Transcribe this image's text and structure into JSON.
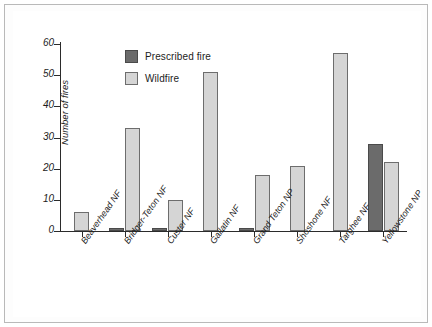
{
  "chart_data": {
    "type": "bar",
    "title": "",
    "xlabel": "",
    "ylabel": "Number of fires",
    "ylim": [
      0,
      60
    ],
    "yticks": [
      0,
      10,
      20,
      30,
      40,
      50,
      60
    ],
    "grid": false,
    "legend_position": "top-left",
    "categories": [
      "Beaverhead NF",
      "Bridger-Teton NF",
      "Custer NF",
      "Gallatin NF",
      "Grand Teton NP",
      "Shoshone NF",
      "Targhee NF",
      "Yellowstone NP"
    ],
    "series": [
      {
        "name": "Prescribed fire",
        "color": "#6b6b6b",
        "values": [
          0,
          1,
          1,
          0,
          1,
          0,
          0,
          28
        ]
      },
      {
        "name": "Wildfire",
        "color": "#d5d5d5",
        "values": [
          6,
          33,
          10,
          51,
          18,
          21,
          57,
          22
        ]
      }
    ]
  }
}
